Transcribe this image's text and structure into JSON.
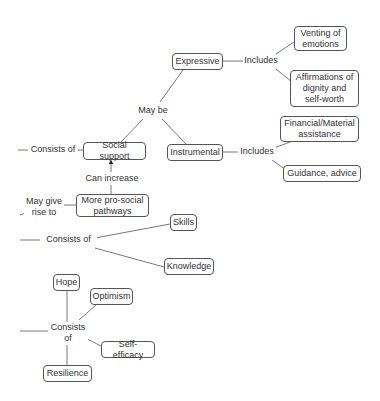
{
  "diagram": {
    "type": "concept-map",
    "colors": {
      "line": "#555555",
      "text": "#333333",
      "node_border": "#555555",
      "background": "#ffffff"
    },
    "nodes": {
      "expressive": "Expressive",
      "venting": "Venting of\nemotions",
      "affirmations": "Affirmations of\ndignity and\nself-worth",
      "instrumental": "Instrumental",
      "financial": "Financial/Material\nassistance",
      "guidance": "Guidance, advice",
      "social_support": "Social support",
      "pro_social": "More pro-social\npathways",
      "skills": "Skills",
      "knowledge": "Knowledge",
      "hope": "Hope",
      "optimism": "Optimism",
      "self_efficacy": "Self-efficacy",
      "resilience": "Resilience"
    },
    "link_labels": {
      "includes_expressive": "Includes",
      "may_be": "May be",
      "includes_instrumental": "Includes",
      "consists_of_social": "Consists of",
      "can_increase": "Can increase",
      "may_give_rise_to": "May give\nrise to",
      "consists_of_skills": "Consists of",
      "consists_of_hope": "Consists\nof"
    },
    "edges": [
      [
        "social_support",
        "may_be"
      ],
      [
        "may_be",
        "expressive"
      ],
      [
        "may_be",
        "instrumental"
      ],
      [
        "expressive",
        "includes_expressive"
      ],
      [
        "includes_expressive",
        "venting"
      ],
      [
        "includes_expressive",
        "affirmations"
      ],
      [
        "instrumental",
        "includes_instrumental"
      ],
      [
        "includes_instrumental",
        "financial"
      ],
      [
        "includes_instrumental",
        "guidance"
      ],
      [
        "consists_of_social",
        "social_support"
      ],
      [
        "pro_social",
        "can_increase"
      ],
      [
        "can_increase",
        "social_support"
      ],
      [
        "may_give_rise_to",
        "pro_social"
      ],
      [
        "consists_of_skills",
        "skills"
      ],
      [
        "consists_of_skills",
        "knowledge"
      ],
      [
        "consists_of_hope",
        "hope"
      ],
      [
        "consists_of_hope",
        "optimism"
      ],
      [
        "consists_of_hope",
        "self_efficacy"
      ],
      [
        "consists_of_hope",
        "resilience"
      ]
    ]
  }
}
